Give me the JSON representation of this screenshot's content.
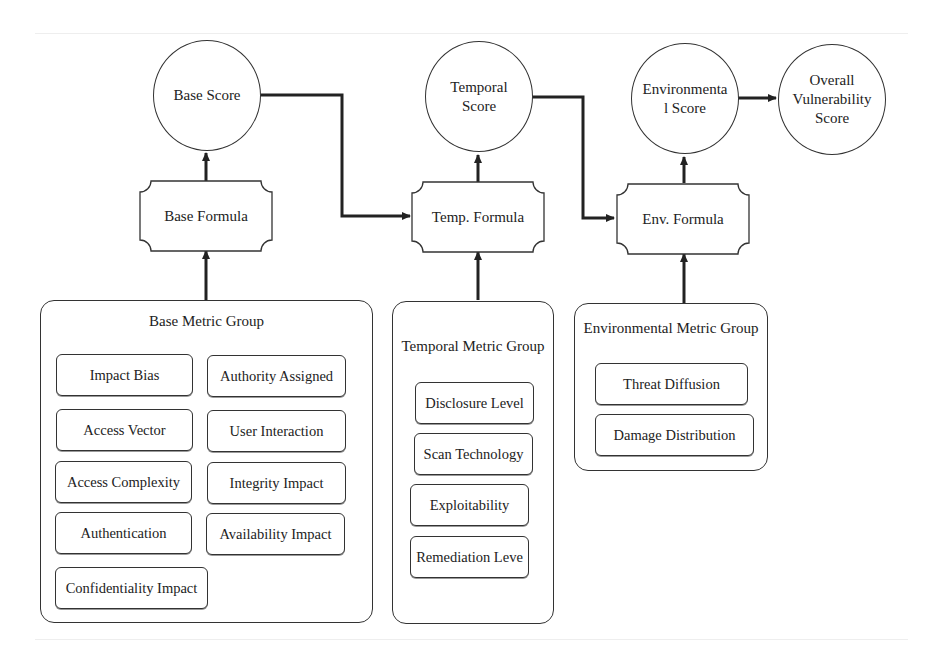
{
  "diagram": {
    "scores": {
      "base": "Base Score",
      "temporal": "Temporal\nScore",
      "environmental": "Environmenta\nl Score",
      "overall": "Overall\nVulnerability\nScore"
    },
    "formulas": {
      "base": "Base Formula",
      "temporal": "Temp. Formula",
      "environmental": "Env. Formula"
    },
    "groups": {
      "base": {
        "title": "Base Metric Group",
        "metrics": [
          "Impact Bias",
          "Authority Assigned",
          "Access Vector",
          "User Interaction",
          "Access Complexity",
          "Integrity Impact",
          "Authentication",
          "Availability Impact",
          "Confidentiality Impact"
        ]
      },
      "temporal": {
        "title": "Temporal Metric Group",
        "metrics": [
          "Disclosure Level",
          "Scan Technology",
          "Exploitability",
          "Remediation Leve"
        ]
      },
      "environmental": {
        "title": "Environmental Metric Group",
        "metrics": [
          "Threat Diffusion",
          "Damage Distribution"
        ]
      }
    },
    "colors": {
      "stroke": "#333333",
      "background": "#ffffff"
    }
  }
}
